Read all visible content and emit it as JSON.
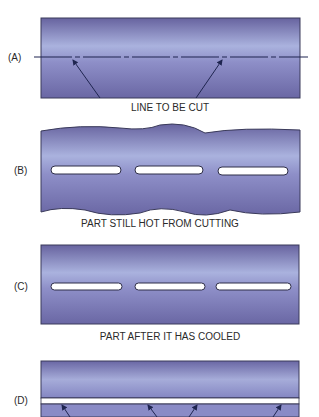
{
  "figure": {
    "panels": [
      {
        "id": "A",
        "label": "(A)",
        "caption": "LINE TO BE CUT"
      },
      {
        "id": "B",
        "label": "(B)",
        "caption": "PART STILL HOT FROM CUTTING"
      },
      {
        "id": "C",
        "label": "(C)",
        "caption": "PART AFTER IT HAS COOLED"
      },
      {
        "id": "D",
        "label": "(D)",
        "caption": ""
      }
    ],
    "colors": {
      "plate_dark": "#6b68a6",
      "plate_light": "#a9b0dc",
      "outline": "#3a3a5a",
      "slot_fill": "#ffffff",
      "text": "#2a2a2a"
    }
  }
}
